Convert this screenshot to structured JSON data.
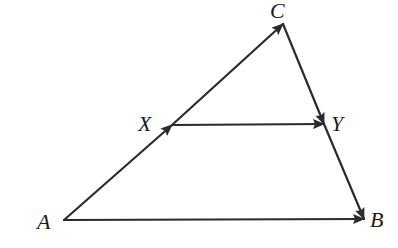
{
  "diagram": {
    "type": "vector-triangle",
    "stroke_color": "#2b2b2b",
    "background": "#ffffff",
    "points": {
      "A": {
        "x": 64,
        "y": 220
      },
      "B": {
        "x": 364,
        "y": 219
      },
      "C": {
        "x": 283,
        "y": 24
      },
      "X": {
        "x": 172,
        "y": 125
      },
      "Y": {
        "x": 324,
        "y": 124
      }
    },
    "vectors": [
      {
        "from": "A",
        "to": "X",
        "arrow": "end"
      },
      {
        "from": "X",
        "to": "C",
        "arrow": "end"
      },
      {
        "from": "X",
        "to": "Y",
        "arrow": "end"
      },
      {
        "from": "C",
        "to": "Y",
        "arrow": "end"
      },
      {
        "from": "Y",
        "to": "B",
        "arrow": "end"
      },
      {
        "from": "A",
        "to": "B",
        "arrow": "end"
      }
    ],
    "labels": {
      "A": {
        "text": "A",
        "x": 37,
        "y": 211
      },
      "B": {
        "text": "B",
        "x": 370,
        "y": 209
      },
      "C": {
        "text": "C",
        "x": 270,
        "y": 0
      },
      "X": {
        "text": "X",
        "x": 138,
        "y": 113
      },
      "Y": {
        "text": "Y",
        "x": 331,
        "y": 113
      }
    }
  }
}
